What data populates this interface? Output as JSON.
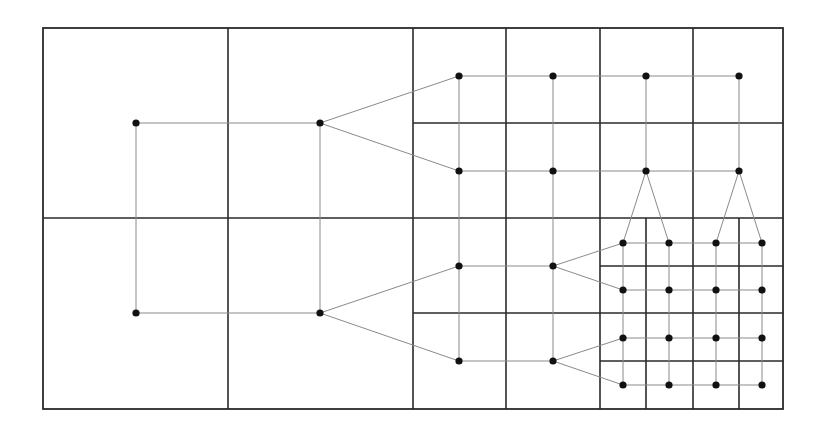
{
  "diagram": {
    "title": "",
    "type": "hierarchical grid refinement with node connectivity",
    "colors": {
      "background": "#ffffff",
      "cell_border": "#2a2a2a",
      "edge": "#8a8a8a",
      "node": "#111111"
    },
    "outer_box": {
      "x1": 43,
      "y1": 28,
      "x2": 783,
      "y2": 409
    },
    "grid_lines": [
      {
        "id": "l0-v1",
        "x1": 228,
        "y1": 28,
        "x2": 228,
        "y2": 409
      },
      {
        "id": "l0-v2",
        "x1": 413,
        "y1": 28,
        "x2": 413,
        "y2": 409
      },
      {
        "id": "l0-h1",
        "x1": 43,
        "y1": 218,
        "x2": 783,
        "y2": 218
      },
      {
        "id": "l1-v1",
        "x1": 506,
        "y1": 28,
        "x2": 506,
        "y2": 409
      },
      {
        "id": "l1-v2",
        "x1": 600,
        "y1": 28,
        "x2": 600,
        "y2": 409
      },
      {
        "id": "l1-v3",
        "x1": 693,
        "y1": 28,
        "x2": 693,
        "y2": 218
      },
      {
        "id": "l1-h1",
        "x1": 413,
        "y1": 123,
        "x2": 783,
        "y2": 123
      },
      {
        "id": "l1-h2",
        "x1": 413,
        "y1": 313,
        "x2": 783,
        "y2": 313
      },
      {
        "id": "l2-v1",
        "x1": 646,
        "y1": 218,
        "x2": 646,
        "y2": 409
      },
      {
        "id": "l2-v2",
        "x1": 693,
        "y1": 218,
        "x2": 693,
        "y2": 409
      },
      {
        "id": "l2-v3",
        "x1": 739,
        "y1": 218,
        "x2": 739,
        "y2": 409
      },
      {
        "id": "l2-h1",
        "x1": 600,
        "y1": 266,
        "x2": 783,
        "y2": 266
      },
      {
        "id": "l2-h2",
        "x1": 600,
        "y1": 361,
        "x2": 783,
        "y2": 361
      }
    ],
    "nodes": [
      {
        "id": "a1",
        "x": 136,
        "y": 123
      },
      {
        "id": "a2",
        "x": 136,
        "y": 313
      },
      {
        "id": "b1",
        "x": 320,
        "y": 123
      },
      {
        "id": "b2",
        "x": 320,
        "y": 313
      },
      {
        "id": "c1",
        "x": 459,
        "y": 76
      },
      {
        "id": "c2",
        "x": 553,
        "y": 76
      },
      {
        "id": "c3",
        "x": 646,
        "y": 76
      },
      {
        "id": "c4",
        "x": 739,
        "y": 76
      },
      {
        "id": "d1",
        "x": 459,
        "y": 171
      },
      {
        "id": "d2",
        "x": 553,
        "y": 171
      },
      {
        "id": "d3",
        "x": 646,
        "y": 171
      },
      {
        "id": "d4",
        "x": 739,
        "y": 171
      },
      {
        "id": "e1",
        "x": 459,
        "y": 266
      },
      {
        "id": "e2",
        "x": 553,
        "y": 266
      },
      {
        "id": "f1",
        "x": 459,
        "y": 361
      },
      {
        "id": "f2",
        "x": 553,
        "y": 361
      },
      {
        "id": "g1",
        "x": 623,
        "y": 243
      },
      {
        "id": "g2",
        "x": 669,
        "y": 243
      },
      {
        "id": "g3",
        "x": 716,
        "y": 243
      },
      {
        "id": "g4",
        "x": 762,
        "y": 243
      },
      {
        "id": "h1",
        "x": 623,
        "y": 290
      },
      {
        "id": "h2",
        "x": 669,
        "y": 290
      },
      {
        "id": "h3",
        "x": 716,
        "y": 290
      },
      {
        "id": "h4",
        "x": 762,
        "y": 290
      },
      {
        "id": "i1",
        "x": 623,
        "y": 338
      },
      {
        "id": "i2",
        "x": 669,
        "y": 338
      },
      {
        "id": "i3",
        "x": 716,
        "y": 338
      },
      {
        "id": "i4",
        "x": 762,
        "y": 338
      },
      {
        "id": "j1",
        "x": 623,
        "y": 385
      },
      {
        "id": "j2",
        "x": 669,
        "y": 385
      },
      {
        "id": "j3",
        "x": 716,
        "y": 385
      },
      {
        "id": "j4",
        "x": 762,
        "y": 385
      }
    ],
    "edges": [
      [
        "a1",
        "b1"
      ],
      [
        "a2",
        "b2"
      ],
      [
        "a1",
        "a2"
      ],
      [
        "b1",
        "b2"
      ],
      [
        "b1",
        "c1"
      ],
      [
        "b1",
        "d1"
      ],
      [
        "b2",
        "e1"
      ],
      [
        "b2",
        "f1"
      ],
      [
        "c1",
        "c2"
      ],
      [
        "c2",
        "c3"
      ],
      [
        "c3",
        "c4"
      ],
      [
        "d1",
        "d2"
      ],
      [
        "d2",
        "d3"
      ],
      [
        "d3",
        "d4"
      ],
      [
        "c1",
        "d1"
      ],
      [
        "c2",
        "d2"
      ],
      [
        "c3",
        "d3"
      ],
      [
        "c4",
        "d4"
      ],
      [
        "d1",
        "e1"
      ],
      [
        "d2",
        "e2"
      ],
      [
        "e1",
        "e2"
      ],
      [
        "f1",
        "f2"
      ],
      [
        "e1",
        "f1"
      ],
      [
        "e2",
        "f2"
      ],
      [
        "d3",
        "g1"
      ],
      [
        "d3",
        "g2"
      ],
      [
        "d4",
        "g3"
      ],
      [
        "d4",
        "g4"
      ],
      [
        "e2",
        "g1"
      ],
      [
        "e2",
        "h1"
      ],
      [
        "f2",
        "i1"
      ],
      [
        "f2",
        "j1"
      ],
      [
        "g1",
        "g2"
      ],
      [
        "g2",
        "g3"
      ],
      [
        "g3",
        "g4"
      ],
      [
        "h1",
        "h2"
      ],
      [
        "h2",
        "h3"
      ],
      [
        "h3",
        "h4"
      ],
      [
        "i1",
        "i2"
      ],
      [
        "i2",
        "i3"
      ],
      [
        "i3",
        "i4"
      ],
      [
        "j1",
        "j2"
      ],
      [
        "j2",
        "j3"
      ],
      [
        "j3",
        "j4"
      ],
      [
        "g1",
        "h1"
      ],
      [
        "h1",
        "i1"
      ],
      [
        "i1",
        "j1"
      ],
      [
        "g2",
        "h2"
      ],
      [
        "h2",
        "i2"
      ],
      [
        "i2",
        "j2"
      ],
      [
        "g3",
        "h3"
      ],
      [
        "h3",
        "i3"
      ],
      [
        "i3",
        "j3"
      ],
      [
        "g4",
        "h4"
      ],
      [
        "h4",
        "i4"
      ],
      [
        "i4",
        "j4"
      ]
    ],
    "node_radius": 3.6
  }
}
